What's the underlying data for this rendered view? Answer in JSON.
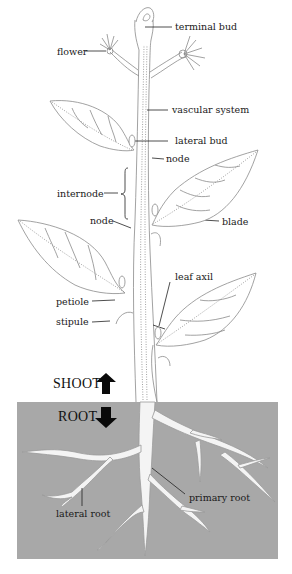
{
  "diagram": {
    "type": "labeled plant anatomy illustration",
    "colors": {
      "background": "#ffffff",
      "soil": "#a8a8a8",
      "line": "#8a8a8a",
      "label_text": "#1a1a1a",
      "root_fill": "#f4f4f4",
      "arrow": "#0a0a0a"
    },
    "sections": {
      "shoot": "SHOOT",
      "root": "ROOT"
    },
    "labels": {
      "terminal_bud": "terminal bud",
      "flower": "flower",
      "vascular_system": "vascular system",
      "lateral_bud": "lateral bud",
      "node_upper": "node",
      "internode": "internode",
      "node_lower": "node",
      "blade": "blade",
      "leaf_axil": "leaf axil",
      "petiole": "petiole",
      "stipule": "stipule",
      "primary_root": "primary root",
      "lateral_root": "lateral root"
    },
    "icons": {
      "shoot_arrow": "arrow-up-icon",
      "root_arrow": "arrow-down-icon"
    }
  }
}
